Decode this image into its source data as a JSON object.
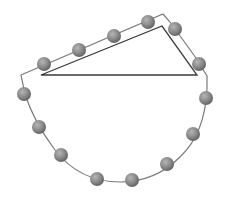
{
  "diagram": {
    "bead_count": 14,
    "colors": {
      "background": "#ffffff",
      "string": "#7a7a7a",
      "triangle": "#3a3a3a",
      "bead_light": "#b5b5b5",
      "bead_mid": "#8a8a8a",
      "bead_dark": "#5e5e5e"
    },
    "shapes": [
      "string-loop",
      "right-triangle",
      "beads"
    ]
  }
}
